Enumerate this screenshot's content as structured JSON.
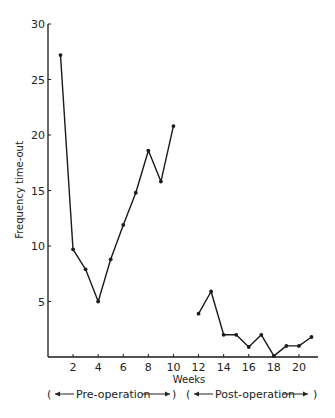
{
  "chart_data": {
    "type": "line",
    "title": "",
    "xlabel": "Weeks",
    "ylabel": "Frequency time-out",
    "xlim": [
      0,
      21
    ],
    "ylim": [
      0,
      30
    ],
    "x_ticks": [
      2,
      4,
      6,
      8,
      10,
      12,
      14,
      16,
      18,
      20
    ],
    "y_ticks": [
      5,
      10,
      15,
      20,
      25,
      30
    ],
    "grid": false,
    "legend": null,
    "series": [
      {
        "name": "Pre-operation",
        "x": [
          1,
          2,
          3,
          4,
          5,
          6,
          7,
          8,
          9,
          10
        ],
        "values": [
          27.2,
          9.7,
          7.9,
          5.0,
          8.8,
          11.9,
          14.8,
          18.6,
          15.8,
          20.8
        ]
      },
      {
        "name": "Post-operation",
        "x": [
          12,
          13,
          14,
          15,
          16,
          17,
          18,
          19,
          20,
          21
        ],
        "values": [
          3.9,
          5.9,
          2.0,
          2.0,
          0.9,
          2.0,
          0.1,
          1.0,
          1.0,
          1.8
        ]
      }
    ],
    "annotations": [
      {
        "text": "Pre-operation",
        "span": [
          1,
          10
        ]
      },
      {
        "text": "Post-operation",
        "span": [
          12,
          21
        ]
      }
    ]
  },
  "labels": {
    "xlabel": "Weeks",
    "ylabel": "Frequency time-out",
    "pre": "Pre-operation",
    "post": "Post-operation"
  },
  "colors": {
    "line": "#1a1a1a",
    "axis": "#1a1a1a",
    "background": "#ffffff"
  }
}
